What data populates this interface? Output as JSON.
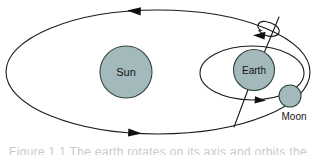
{
  "figure": {
    "background_color": "#ffffff",
    "line_color": "#1a1a1a",
    "body_fill_color": "#a3b9bc",
    "body_stroke_color": "#33443f",
    "caption_partial": "Figure 1.1  The earth rotates on its axis and orbits the"
  },
  "bodies": {
    "sun": {
      "label": "Sun",
      "cx": 126,
      "cy": 72,
      "r": 26,
      "fill": "#a3b9bc"
    },
    "earth": {
      "label": "Earth",
      "cx": 254,
      "cy": 70,
      "r": 20.5,
      "fill": "#a3b9bc"
    },
    "moon": {
      "label": "Moon",
      "cx": 290,
      "cy": 96,
      "r": 11,
      "fill": "#a3b9bc",
      "label_x": 294,
      "label_y": 116
    }
  },
  "orbits": {
    "earth_around_sun": {
      "name": "earth-orbit-ellipse",
      "cx": 158,
      "cy": 72,
      "rx": 152,
      "ry": 62,
      "direction": "counterclockwise",
      "arrow_top_direction": "left",
      "arrow_bottom_direction": "right"
    },
    "moon_around_earth": {
      "name": "moon-orbit-ellipse",
      "cx": 252,
      "cy": 73,
      "rx": 52,
      "ry": 27,
      "direction": "counterclockwise",
      "arrow_bottom_direction": "right"
    }
  },
  "axis": {
    "name": "earth-rotation-axis",
    "x1": 279,
    "y1": 17,
    "x2": 234,
    "y2": 127,
    "tilted": true,
    "spin_arrow_direction": "counterclockwise"
  }
}
